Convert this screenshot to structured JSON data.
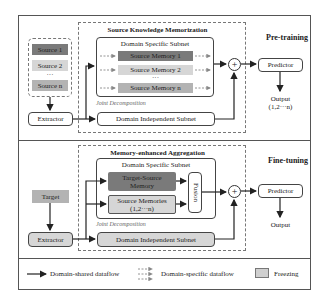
{
  "pretraining": {
    "stage_label": "Pre-training",
    "sources": [
      "Source 1",
      "Source 2",
      "···",
      "Source n"
    ],
    "extractor": "Extractor",
    "module_title": "Source Knowledge Memorization",
    "dss_title": "Domain Specific Subnet",
    "memories": [
      "Source Memory 1",
      "Source Memory  2",
      "Source Memory  n"
    ],
    "memory_ellipsis": "···",
    "joint_decomposition": "Joint Decomposition",
    "dis": "Domain Independent Subnet",
    "plus": "+",
    "predictor": "Predictor",
    "output_line1": "Output",
    "output_line2": "(1,2···n)"
  },
  "finetuning": {
    "stage_label": "Fine-tuning",
    "target": "Target",
    "extractor": "Extractor",
    "module_title": "Memory-enhanced Aggregation",
    "dss_title": "Domain Specific Subnet",
    "target_source_memory_line1": "Target-Source",
    "target_source_memory_line2": "Memory",
    "source_memories_line1": "Source Memories",
    "source_memories_line2": "(1,2···n)",
    "fusion": "Fusion",
    "joint_decomposition": "Joint Decomposition",
    "dis": "Domain Independent Subnet",
    "plus": "+",
    "predictor": "Predictor",
    "output": "Output"
  },
  "legend": {
    "shared": "Domain-shared dataflow",
    "specific": "Domain-specific dataflow",
    "freezing": "Freezing"
  },
  "colors": {
    "dark_block": "#7a7a7a",
    "mid_block": "#b3b3b3",
    "frozen_block": "#d6d6d6",
    "line": "#222222"
  }
}
